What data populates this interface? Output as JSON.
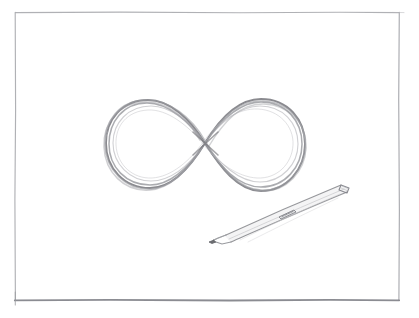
{
  "scene": {
    "kind": "pencil-sketch",
    "title": "Infinity symbol pencil sketch with pen",
    "medium": "graphite pencil on white paper",
    "canvas": {
      "width": 419,
      "height": 318
    },
    "paper_color": "#ffffff",
    "graphite_color": "#9a9a9e",
    "graphite_dark_color": "#6f7074",
    "graphite_light_color": "#c3c4c8",
    "frame_color": "#a7a8ad",
    "frame_dark_color": "#7f8086"
  },
  "frame": {
    "name": "hand-drawn border rectangle",
    "left": 15,
    "top": 12,
    "right": 399,
    "bottom": 300,
    "stroke_width": 1.2,
    "bottom_stroke_width": 1.9
  },
  "infinity": {
    "name": "infinity symbol",
    "glyph": "∞",
    "center_x": 205,
    "center_y": 143,
    "bbox": {
      "x": 105,
      "y": 99,
      "width": 200,
      "height": 93
    },
    "crossing_point": {
      "x": 205,
      "y": 143
    },
    "left_loop_center": {
      "x": 152,
      "y": 143
    },
    "right_loop_center": {
      "x": 258,
      "y": 143
    },
    "stroke_passes": 7,
    "stroke_color": "#8e8f94"
  },
  "pen": {
    "name": "mechanical pencil",
    "tip": {
      "x": 212,
      "y": 240
    },
    "top_end": {
      "x": 349,
      "y": 187
    },
    "length": 145,
    "angle_deg": -20,
    "barrel_color": "#b9babe",
    "outline_color": "#8d8e93",
    "grip_band": {
      "x": 279,
      "y": 207,
      "width": 16,
      "height": 11
    }
  },
  "labels": {
    "alt_text": "A light pencil sketch of an infinity symbol drawn with several overlapping loose strokes, with a mechanical pencil resting below and to the right, all framed by a thin hand-ruled rectangle."
  }
}
